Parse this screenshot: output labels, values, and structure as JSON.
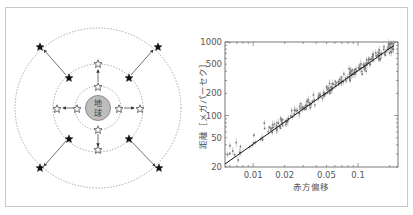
{
  "diagram": {
    "center_label_line1": "地",
    "center_label_line2": "球",
    "center_label": "地球",
    "rings": [
      "inner",
      "middle",
      "outer"
    ],
    "legend": {
      "hollow_star": "near galaxy",
      "filled_star": "far galaxy"
    }
  },
  "chart_data": {
    "type": "scatter",
    "title": "",
    "xlabel": "赤方偏移",
    "ylabel": "距離［メガパーセク］",
    "xscale": "log",
    "yscale": "log",
    "xlim": [
      0.0054,
      0.24
    ],
    "ylim": [
      20,
      1000
    ],
    "x_ticks": [
      "0.01",
      "0.02",
      "0.05",
      "0.1"
    ],
    "y_ticks": [
      "20",
      "50",
      "100",
      "200",
      "500",
      "1000"
    ],
    "grid": false,
    "fit_line": {
      "description": "linear Hubble relation",
      "points": [
        [
          0.0054,
          22
        ],
        [
          0.22,
          900
        ]
      ]
    },
    "series": [
      {
        "name": "galaxies",
        "x": [
          0.006,
          0.0065,
          0.007,
          0.0075,
          0.008,
          0.009,
          0.01,
          0.011,
          0.012,
          0.013,
          0.014,
          0.015,
          0.016,
          0.017,
          0.018,
          0.02,
          0.022,
          0.025,
          0.028,
          0.03,
          0.033,
          0.036,
          0.04,
          0.045,
          0.05,
          0.055,
          0.06,
          0.07,
          0.08,
          0.09,
          0.1,
          0.11,
          0.12,
          0.13,
          0.15,
          0.17,
          0.19,
          0.21
        ],
        "y": [
          30,
          35,
          28,
          38,
          32,
          40,
          45,
          48,
          52,
          75,
          62,
          65,
          70,
          72,
          80,
          85,
          95,
          105,
          120,
          135,
          140,
          155,
          170,
          190,
          210,
          240,
          260,
          300,
          340,
          380,
          420,
          460,
          510,
          560,
          640,
          720,
          810,
          880
        ]
      }
    ]
  }
}
